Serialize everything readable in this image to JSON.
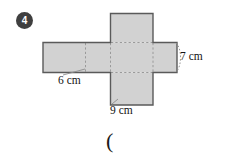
{
  "page": {
    "background_color": "#ffffff",
    "width": 227,
    "height": 161
  },
  "question": {
    "number": "4",
    "badge_shape": "filled-circle",
    "badge_color": "#3f3f3f",
    "badge_text_color": "#ffffff"
  },
  "figure": {
    "name": "cuboid-net",
    "fill_color": "#d2d2d2",
    "outline_color": "#5a5a5a",
    "fold_line_color": "#9a9a9a",
    "fold_line_style": "dashed"
  },
  "labels": {
    "length_6": "6 cm",
    "length_9": "9 cm",
    "length_7": "7 cm"
  },
  "dimensions": {
    "width_label": "6 cm",
    "depth_label": "9 cm",
    "height_label": "7 cm",
    "unit": "cm",
    "values": [
      6,
      9,
      7
    ]
  },
  "answer_field": {
    "open_paren": "("
  }
}
